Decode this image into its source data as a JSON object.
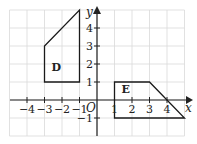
{
  "diagram": {
    "type": "coordinate-grid",
    "origin_label": "O",
    "x_axis_label": "x",
    "y_axis_label": "y",
    "x_range": [
      -5,
      5
    ],
    "y_range": [
      -2,
      5
    ],
    "x_tick_labels": [
      "−4",
      "−3",
      "−2",
      "−1",
      "1",
      "2",
      "3",
      "4"
    ],
    "x_tick_values": [
      -4,
      -3,
      -2,
      -1,
      1,
      2,
      3,
      4
    ],
    "y_tick_labels": [
      "−1",
      "1",
      "2",
      "3",
      "4"
    ],
    "y_tick_values": [
      -1,
      1,
      2,
      3,
      4
    ],
    "shapes": [
      {
        "name": "D",
        "label": "D",
        "vertices": [
          [
            -3,
            1
          ],
          [
            -1,
            1
          ],
          [
            -1,
            5
          ],
          [
            -3,
            3
          ]
        ],
        "label_pos": [
          -2.6,
          1.6
        ]
      },
      {
        "name": "E",
        "label": "E",
        "vertices": [
          [
            1,
            1
          ],
          [
            3,
            1
          ],
          [
            5,
            -1
          ],
          [
            1,
            -1
          ]
        ],
        "label_pos": [
          1.4,
          0.4
        ]
      }
    ],
    "colors": {
      "grid": "#d9d9d9",
      "axis": "#222222",
      "shape": "#1a1a1a",
      "background": "#ffffff"
    }
  }
}
